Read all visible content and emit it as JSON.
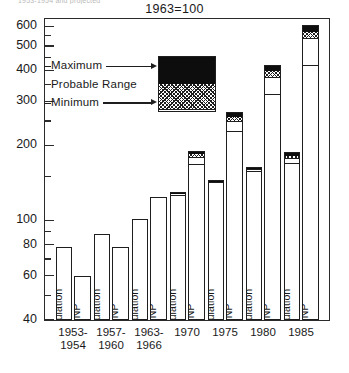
{
  "caption_cutoff": "1953-1954 and projected",
  "title": "1963=100",
  "axis": {
    "ylabels": [
      "600",
      "500",
      "400",
      "300",
      "200",
      "100",
      "80",
      "60",
      "40"
    ],
    "ymin": 40,
    "ymax": 640
  },
  "legend": {
    "maximum_label": "Maximum",
    "probable_label": "Probable  Range",
    "minimum_label": "Minimum",
    "key_min": 280,
    "key_prob": 355,
    "key_max": 455
  },
  "series_labels": {
    "population": "Population",
    "gnp": "GNP"
  },
  "chart_data": {
    "type": "bar",
    "title": "1963=100",
    "subtitle": "",
    "xlabel": "",
    "ylabel": "",
    "scale": "log",
    "ylim": [
      40,
      640
    ],
    "yticks": [
      40,
      60,
      80,
      100,
      200,
      300,
      400,
      500,
      600
    ],
    "grid": false,
    "legend_position": "inside-upper-left",
    "legend_entries": [
      "Maximum",
      "Probable  Range",
      "Minimum"
    ],
    "categories": [
      "1953-\n1954",
      "1957-\n1960",
      "1963-\n1966",
      "1970",
      "1975",
      "1980",
      "1985"
    ],
    "category_lines": [
      [
        "1953-",
        "1954"
      ],
      [
        "1957-",
        "1960"
      ],
      [
        "1963-",
        "1966"
      ],
      [
        "1970",
        ""
      ],
      [
        "1975",
        ""
      ],
      [
        "1980",
        ""
      ],
      [
        "1985",
        ""
      ]
    ],
    "series": [
      {
        "name": "Population",
        "values": [
          78,
          88,
          101,
          130,
          145,
          163,
          188
        ],
        "minimum": [
          78,
          88,
          101,
          127,
          143,
          158,
          170
        ],
        "probable": [
          78,
          88,
          101,
          129,
          144,
          161,
          178
        ],
        "maximum": [
          78,
          88,
          101,
          130,
          145,
          163,
          188
        ]
      },
      {
        "name": "GNP",
        "values": [
          60,
          78,
          124,
          190,
          272,
          420,
          605
        ],
        "minimum": [
          60,
          78,
          124,
          168,
          228,
          320,
          420
        ],
        "probable": [
          60,
          78,
          124,
          180,
          250,
          375,
          540
        ],
        "maximum": [
          60,
          78,
          124,
          190,
          272,
          420,
          605
        ]
      }
    ]
  }
}
